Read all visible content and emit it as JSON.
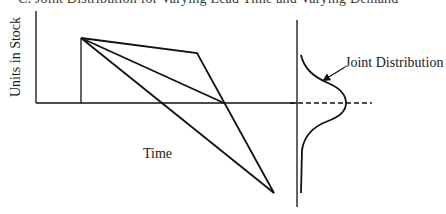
{
  "figure": {
    "title": "C. Joint Distribution for Varying Lead Time and Varying Demand",
    "y_axis_label": "Units in Stock",
    "x_axis_label": "Time",
    "annotation": "Joint Distribution",
    "colors": {
      "ink": "#111111",
      "background": "#ffffff"
    }
  },
  "diagram": {
    "elements": [
      {
        "id": "y-axis",
        "type": "line",
        "from": [
          36,
          11
        ],
        "to": [
          36,
          103
        ]
      },
      {
        "id": "x-axis",
        "type": "line",
        "from": [
          36,
          103
        ],
        "to": [
          297,
          103
        ]
      },
      {
        "id": "reorder-vertical",
        "type": "line",
        "from": [
          81,
          103
        ],
        "to": [
          81,
          38
        ]
      },
      {
        "id": "slow-demand-path",
        "type": "polyline",
        "points": [
          [
            81,
            38
          ],
          [
            197,
            53
          ],
          [
            274,
            193
          ]
        ]
      },
      {
        "id": "average-demand-path",
        "type": "line",
        "from": [
          81,
          38
        ],
        "to": [
          224,
          103
        ]
      },
      {
        "id": "fast-demand-path",
        "type": "line",
        "from": [
          81,
          38
        ],
        "to": [
          274,
          193
        ]
      },
      {
        "id": "distribution-axis",
        "type": "line",
        "from": [
          297,
          20
        ],
        "to": [
          297,
          207
        ]
      },
      {
        "id": "mean-dashed-line",
        "type": "dashed-line",
        "from": [
          290,
          103
        ],
        "to": [
          372,
          103
        ]
      },
      {
        "id": "joint-distribution-curve",
        "type": "curve",
        "peak": [
          346,
          103
        ],
        "top": [
          301,
          55
        ],
        "tail_bottom": [
          301,
          193
        ]
      },
      {
        "id": "annotation-arrow",
        "type": "arrow",
        "from": [
          345,
          67
        ],
        "to": [
          323,
          81
        ]
      }
    ]
  }
}
